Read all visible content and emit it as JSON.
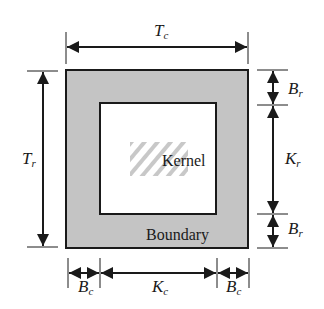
{
  "diagram": {
    "regions": {
      "boundary": {
        "label": "Boundary",
        "fill": "#c4c4c4"
      },
      "kernel": {
        "label": "Kernel",
        "fill": "#ffffff",
        "hatch": "#bdbdbd"
      }
    },
    "dimensions": {
      "top": {
        "main": "T",
        "sub": "c"
      },
      "left": {
        "main": "T",
        "sub": "r"
      },
      "right": [
        {
          "main": "B",
          "sub": "r"
        },
        {
          "main": "K",
          "sub": "r"
        },
        {
          "main": "B",
          "sub": "r"
        }
      ],
      "bottom": [
        {
          "main": "B",
          "sub": "c"
        },
        {
          "main": "K",
          "sub": "c"
        },
        {
          "main": "B",
          "sub": "c"
        }
      ]
    },
    "stroke": "#1a1a1a"
  }
}
